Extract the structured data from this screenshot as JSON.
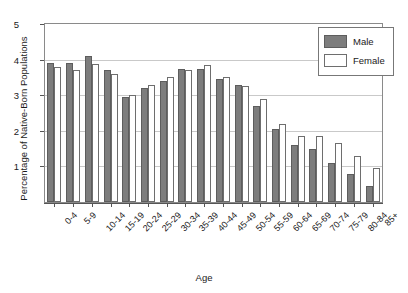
{
  "chart_data": {
    "type": "bar",
    "title": "",
    "xlabel": "Age",
    "ylabel": "Percentage of Native-Born Populations",
    "ylim": [
      0,
      5
    ],
    "yticks": [
      0,
      1,
      2,
      3,
      4,
      5
    ],
    "grid": true,
    "legend_position": "top-right",
    "categories": [
      "0-4",
      "5-9",
      "10-14",
      "15-19",
      "20-24",
      "25-29",
      "30-34",
      "35-39",
      "40-44",
      "45-49",
      "50-54",
      "55-59",
      "60-64",
      "65-69",
      "70-74",
      "75-79",
      "80-84",
      "85+"
    ],
    "series": [
      {
        "name": "Male",
        "color": "#7d7d7d",
        "values": [
          3.9,
          3.9,
          4.1,
          3.7,
          2.95,
          3.2,
          3.4,
          3.75,
          3.75,
          3.45,
          3.3,
          2.7,
          2.05,
          1.6,
          1.5,
          1.1,
          0.8,
          0.45
        ]
      },
      {
        "name": "Female",
        "color": "#ffffff",
        "values": [
          3.78,
          3.7,
          3.88,
          3.6,
          3.0,
          3.3,
          3.5,
          3.7,
          3.85,
          3.5,
          3.25,
          2.9,
          2.2,
          1.85,
          1.85,
          1.65,
          1.3,
          0.95
        ]
      }
    ]
  }
}
